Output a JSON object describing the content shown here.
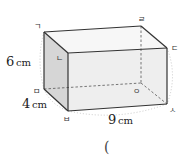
{
  "figure": {
    "type": "rectangular-prism",
    "vertices": {
      "top_back_left": {
        "label": "ㄱ",
        "x": 44,
        "y": 32
      },
      "top_front_left": {
        "label": "ㄴ",
        "x": 68,
        "y": 53
      },
      "top_front_right": {
        "label": "ㄷ",
        "x": 167,
        "y": 48
      },
      "top_back_right": {
        "label": "ㄹ",
        "x": 141,
        "y": 26
      },
      "bottom_back_left": {
        "label": "ㅁ",
        "x": 44,
        "y": 89
      },
      "bottom_front_left": {
        "label": "ㅂ",
        "x": 68,
        "y": 111
      },
      "bottom_front_right": {
        "label": "ㅅ",
        "x": 167,
        "y": 104
      },
      "bottom_back_right": {
        "label": "ㅇ",
        "x": 141,
        "y": 83
      }
    },
    "dimensions": {
      "height": {
        "value": "6",
        "unit": "cm"
      },
      "depth": {
        "value": "4",
        "unit": "cm"
      },
      "width": {
        "value": "9",
        "unit": "cm"
      }
    },
    "colors": {
      "edge": "#333333",
      "hidden_edge": "#555555",
      "front_face": "#eeeeee",
      "side_face": "#d6d6d6",
      "top_face": "#f7f7f7",
      "dimension_arc": "#bbbbbb"
    }
  },
  "answer_blank": {
    "open_paren": "("
  }
}
